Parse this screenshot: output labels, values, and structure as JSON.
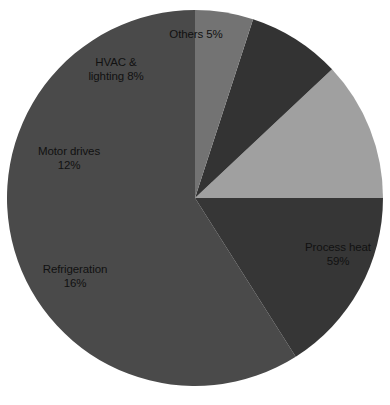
{
  "chart_data": {
    "type": "pie",
    "title": "",
    "subtitle": "",
    "xlabel": "",
    "ylabel": "",
    "legend": "none",
    "grid": false,
    "value_unit": "%",
    "total": 100,
    "start_angle_deg": 90,
    "direction": "counterclockwise",
    "categories": [
      "Process heat",
      "Refrigeration",
      "Motor drives",
      "HVAC & lighting",
      "Others"
    ],
    "values": [
      59,
      16,
      12,
      8,
      5
    ],
    "colors": [
      "#4a4a4a",
      "#363636",
      "#a0a0a0",
      "#333333",
      "#737373"
    ],
    "slices": [
      {
        "name": "process-heat",
        "label_line1": "Process heat",
        "label_line2": "59%",
        "value": 59,
        "color": "#4a4a4a",
        "label_color": "#111111"
      },
      {
        "name": "refrigeration",
        "label_line1": "Refrigeration",
        "label_line2": "16%",
        "value": 16,
        "color": "#363636",
        "label_color": "#111111"
      },
      {
        "name": "motor-drives",
        "label_line1": "Motor drives",
        "label_line2": "12%",
        "value": 12,
        "color": "#a0a0a0",
        "label_color": "#111111"
      },
      {
        "name": "hvac-lighting",
        "label_line1": "HVAC &",
        "label_line2": "lighting 8%",
        "value": 8,
        "color": "#333333",
        "label_color": "#111111"
      },
      {
        "name": "others",
        "label_line1": "Others 5%",
        "label_line2": "",
        "value": 5,
        "color": "#737373",
        "label_color": "#111111"
      }
    ],
    "background": "#ffffff",
    "geometry": {
      "center_x": 195,
      "center_y": 198,
      "radius": 188
    }
  }
}
